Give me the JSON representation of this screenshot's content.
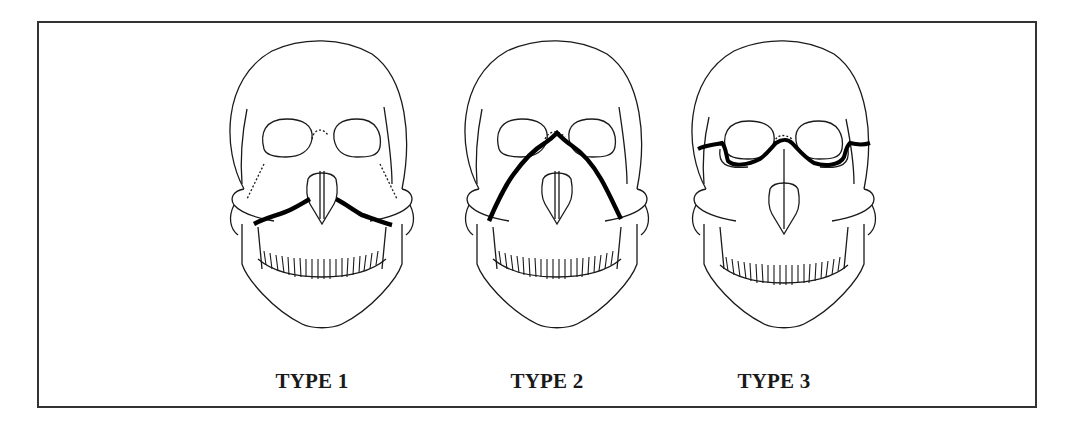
{
  "figure": {
    "title": "",
    "panels": [
      {
        "id": "type-1",
        "label": "TYPE 1",
        "fracture": "Horizontal fracture above teeth across maxilla (Le Fort I)"
      },
      {
        "id": "type-2",
        "label": "TYPE 2",
        "fracture": "Pyramidal fracture through nasal bridge and maxilla (Le Fort II)"
      },
      {
        "id": "type-3",
        "label": "TYPE 3",
        "fracture": "Transverse fracture through orbits and nasal bridge (Le Fort III)"
      }
    ]
  },
  "colors": {
    "line": "#1a1a1a",
    "fracture": "#000000",
    "background": "#ffffff",
    "frame": "#333333"
  }
}
